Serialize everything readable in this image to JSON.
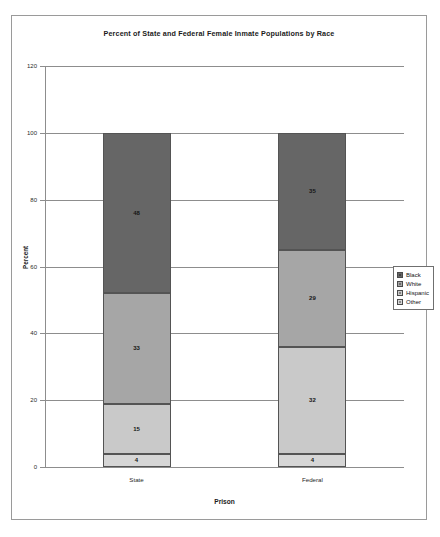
{
  "figure": {
    "title": "Percent of State and Federal Female Inmate Populations by Race"
  },
  "chart_data": {
    "type": "bar",
    "subtype": "stacked-column",
    "title": "Percent of State and Federal Female Inmate Populations by Race",
    "xlabel": "Prison",
    "ylabel": "Percent",
    "categories": [
      "State",
      "Federal"
    ],
    "ylim": [
      0,
      120
    ],
    "yticks": [
      0,
      20,
      40,
      60,
      80,
      100,
      120
    ],
    "ytick_labels": [
      "0",
      "20",
      "40",
      "60",
      "80",
      "100",
      "120"
    ],
    "grid": true,
    "grid_axis": "y",
    "legend_position": "right",
    "stack_order_bottom_to_top": [
      "Other",
      "Hispanic",
      "White",
      "Black"
    ],
    "series": [
      {
        "name": "Black",
        "color": "#666666",
        "values": [
          48,
          35
        ],
        "labels": [
          "48",
          "35"
        ]
      },
      {
        "name": "White",
        "color": "#a6a6a6",
        "values": [
          33,
          29
        ],
        "labels": [
          "33",
          "29"
        ]
      },
      {
        "name": "Hispanic",
        "color": "#c9c9c9",
        "values": [
          15,
          32
        ],
        "labels": [
          "15",
          "32"
        ]
      },
      {
        "name": "Other",
        "color": "#d6d6d6",
        "values": [
          4,
          4
        ],
        "labels": [
          "4",
          "4"
        ]
      }
    ]
  },
  "legend": {
    "items": [
      {
        "label": "Black",
        "color": "#666666"
      },
      {
        "label": "White",
        "color": "#a6a6a6"
      },
      {
        "label": "Hispanic",
        "color": "#c9c9c9"
      },
      {
        "label": "Other",
        "color": "#d6d6d6"
      }
    ]
  }
}
